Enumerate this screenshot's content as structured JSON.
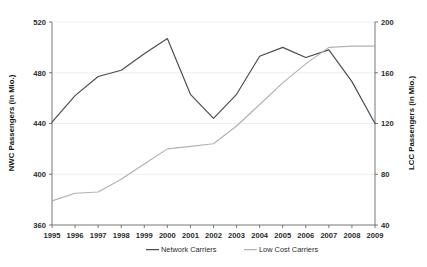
{
  "chart_data": {
    "type": "line",
    "title": "",
    "subtitle": "",
    "xlabel": "",
    "ylabel": "NWC Passengers (in Mio.)",
    "y2label": "LCC Passengers (in Mio.)",
    "grid": true,
    "legend_position": "bottom",
    "categories": [
      "1995",
      "1996",
      "1997",
      "1998",
      "1999",
      "2000",
      "2001",
      "2002",
      "2003",
      "2004",
      "2005",
      "2006",
      "2007",
      "2008",
      "2009"
    ],
    "x": [
      1995,
      1996,
      1997,
      1998,
      1999,
      2000,
      2001,
      2002,
      2003,
      2004,
      2005,
      2006,
      2007,
      2008,
      2009
    ],
    "ylim": [
      360,
      520
    ],
    "y2lim": [
      40,
      200
    ],
    "yticks": [
      "360",
      "400",
      "440",
      "480",
      "520"
    ],
    "ytick_values": [
      360,
      400,
      440,
      480,
      520
    ],
    "y2ticks": [
      "40",
      "80",
      "120",
      "160",
      "200"
    ],
    "y2tick_values": [
      40,
      80,
      120,
      160,
      200
    ],
    "series": [
      {
        "name": "Network Carriers",
        "axis": "left",
        "color": "#4a4a52",
        "values": [
          441,
          462,
          477,
          482,
          495,
          507,
          463,
          444,
          463,
          493,
          500,
          492,
          498,
          473,
          440
        ]
      },
      {
        "name": "Low Cost Carriers",
        "axis": "right",
        "color": "#b2b2b2",
        "values": [
          59,
          65,
          66,
          76,
          88,
          100,
          102,
          104,
          118,
          135,
          152,
          167,
          180,
          181,
          181
        ]
      }
    ]
  },
  "legend": {
    "items": [
      {
        "label": "Network Carriers",
        "color": "#4a4a52"
      },
      {
        "label": "Low Cost Carriers",
        "color": "#b2b2b2"
      }
    ]
  },
  "axes": {
    "left_title": "NWC Passengers (in Mio.)",
    "right_title": "LCC Passengers (in Mio.)"
  }
}
